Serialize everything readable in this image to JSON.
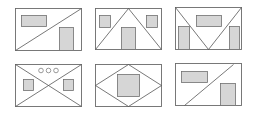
{
  "colors": {
    "background": "#ffffff",
    "frame_stroke": "#6a6a6a",
    "line_stroke": "#555555",
    "placeholder_fill": "#d6d6d6",
    "placeholder_stroke": "#707070"
  },
  "thumbnails": [
    {
      "name": "layout-diagonal-right",
      "row": 1,
      "col": 1
    },
    {
      "name": "layout-house-triangle",
      "row": 1,
      "col": 2
    },
    {
      "name": "layout-v-inverted-triangle",
      "row": 1,
      "col": 3
    },
    {
      "name": "layout-x-cross-dots",
      "row": 2,
      "col": 1,
      "dots": 3
    },
    {
      "name": "layout-diamond-center",
      "row": 2,
      "col": 2
    },
    {
      "name": "layout-diagonal-partial",
      "row": 2,
      "col": 3
    }
  ]
}
